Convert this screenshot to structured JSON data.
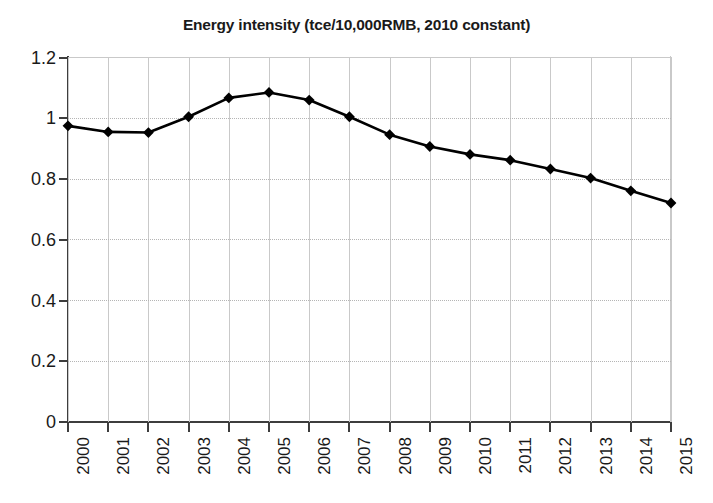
{
  "chart_data": {
    "type": "line",
    "title": "Energy intensity (tce/10,000RMB, 2010 constant)",
    "xlabel": "",
    "ylabel": "",
    "categories": [
      "2000",
      "2001",
      "2002",
      "2003",
      "2004",
      "2005",
      "2006",
      "2007",
      "2008",
      "2009",
      "2010",
      "2011",
      "2012",
      "2013",
      "2014",
      "2015"
    ],
    "values": [
      0.975,
      0.955,
      0.953,
      1.005,
      1.067,
      1.085,
      1.06,
      1.005,
      0.946,
      0.907,
      0.881,
      0.862,
      0.833,
      0.803,
      0.761,
      0.721
    ],
    "series": [
      {
        "name": "Energy intensity",
        "values": [
          0.975,
          0.955,
          0.953,
          1.005,
          1.067,
          1.085,
          1.06,
          1.005,
          0.946,
          0.907,
          0.881,
          0.862,
          0.833,
          0.803,
          0.761,
          0.721
        ]
      }
    ],
    "ylim": [
      0,
      1.2
    ],
    "yticks": [
      "0",
      "0.2",
      "0.4",
      "0.6",
      "0.8",
      "1",
      "1.2"
    ],
    "ytick_values": [
      0,
      0.2,
      0.4,
      0.6,
      0.8,
      1,
      1.2
    ],
    "xtick_rotation": -90,
    "grid": "both",
    "legend": "none",
    "marker": "diamond",
    "line_color": "#000000",
    "marker_color": "#000000",
    "grid_color": "#c9c9c9",
    "axis_color": "#3d3d3d",
    "background": "#ffffff"
  }
}
